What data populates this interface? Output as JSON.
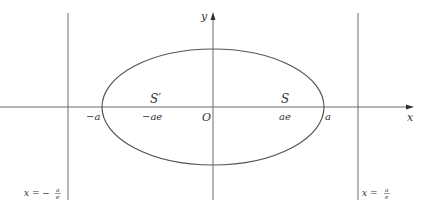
{
  "diagram": {
    "type": "ellipse-with-foci-and-directrices",
    "colors": {
      "line": "#555555",
      "text": "#333333",
      "background": "#ffffff"
    },
    "axes": {
      "x_label": "x",
      "y_label": "y",
      "origin_label": "O"
    },
    "points": {
      "left_vertex": "−a",
      "right_vertex": "a",
      "left_focus_label": "S′",
      "left_focus_coord": "−ae",
      "right_focus_label": "S",
      "right_focus_coord": "ae"
    },
    "directrices": {
      "left": {
        "lhs": "x = −",
        "num": "a",
        "den": "e"
      },
      "right": {
        "lhs": "x = ",
        "num": "a",
        "den": "e"
      }
    }
  }
}
